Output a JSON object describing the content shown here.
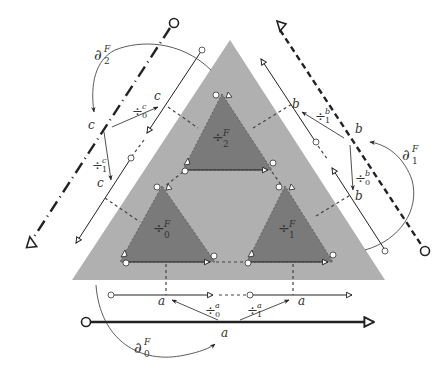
{
  "colors": {
    "outer_face": "#b0b0b0",
    "inner_face": "#7a7a7a",
    "edge": "#222222",
    "background": "#ffffff"
  },
  "faces": {
    "outer": {
      "label": "F"
    },
    "inner": [
      {
        "id": 0,
        "symbol": "÷",
        "sup": "F",
        "sub": "0"
      },
      {
        "id": 1,
        "symbol": "÷",
        "sup": "F",
        "sub": "1"
      },
      {
        "id": 2,
        "symbol": "÷",
        "sup": "F",
        "sub": "2"
      }
    ]
  },
  "edges": {
    "a": {
      "label": "a",
      "sub_labels": [
        "a",
        "a"
      ],
      "maps": [
        {
          "symbol": "÷",
          "sup": "a",
          "sub": "0"
        },
        {
          "symbol": "÷",
          "sup": "a",
          "sub": "1"
        }
      ]
    },
    "b": {
      "label": "b",
      "sub_labels": [
        "b",
        "b"
      ],
      "maps": [
        {
          "symbol": "÷",
          "sup": "b",
          "sub": "0"
        },
        {
          "symbol": "÷",
          "sup": "b",
          "sub": "1"
        }
      ]
    },
    "c": {
      "label": "c",
      "sub_labels": [
        "c",
        "c"
      ],
      "maps": [
        {
          "symbol": "÷",
          "sup": "c",
          "sub": "0"
        },
        {
          "symbol": "÷",
          "sup": "c",
          "sub": "1"
        }
      ]
    }
  },
  "boundary_maps": [
    {
      "symbol": "∂",
      "sup": "F",
      "sub": "0"
    },
    {
      "symbol": "∂",
      "sup": "F",
      "sub": "1"
    },
    {
      "symbol": "∂",
      "sup": "F",
      "sub": "2"
    }
  ]
}
